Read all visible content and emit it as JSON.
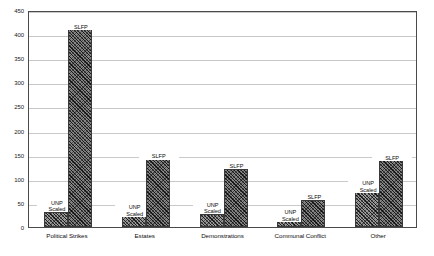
{
  "chart_data": {
    "type": "bar",
    "title": "",
    "xlabel": "",
    "ylabel": "",
    "ylim": [
      0,
      450
    ],
    "ytick_step": 50,
    "yticks": [
      0,
      50,
      100,
      150,
      200,
      250,
      300,
      350,
      400,
      450
    ],
    "ytick_labels": [
      "0",
      "50",
      "100",
      "150",
      "200",
      "250",
      "300",
      "350",
      "400",
      "450"
    ],
    "grid": true,
    "legend_position": "none",
    "categories": [
      "Political Strikes",
      "Estates",
      "Demonstrations",
      "Communal Conflict",
      "Other"
    ],
    "series": [
      {
        "name": "UNP Scaled",
        "label": "UNP\nScaled",
        "values": [
          32,
          22,
          28,
          12,
          72
        ]
      },
      {
        "name": "SLFP",
        "label": "SLFP",
        "values": [
          410,
          141,
          121,
          57,
          138
        ]
      }
    ]
  },
  "axis": {
    "y_labels": [
      {
        "value": 450,
        "text": "450"
      },
      {
        "value": 400,
        "text": "400"
      },
      {
        "value": 350,
        "text": "350"
      },
      {
        "value": 300,
        "text": "300"
      },
      {
        "value": 250,
        "text": "250"
      },
      {
        "value": 200,
        "text": "200"
      },
      {
        "value": 150,
        "text": "150"
      },
      {
        "value": 100,
        "text": "100"
      },
      {
        "value": 50,
        "text": "50"
      },
      {
        "value": 0,
        "text": "0"
      }
    ]
  },
  "style": {
    "frame_color": "#4a4a4a",
    "grid_color": "#c9c9c9",
    "bar_fill": "#8d8d8d",
    "bar_edge": "#3a3a3a",
    "background": "#ffffff"
  }
}
